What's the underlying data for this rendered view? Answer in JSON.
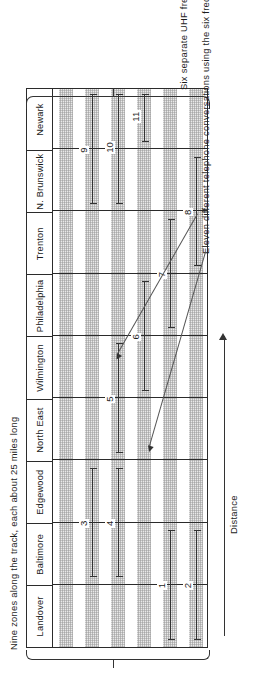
{
  "figure": {
    "caption_zones": "Nine zones along the track, each about 25 miles long",
    "caption_uhf": "Six separate UHF frequencies",
    "caption_conversations": "Eleven different telephone conversations using the six frequencies",
    "axis_label": "Distance",
    "colors": {
      "ink": "#2b2b2b",
      "band": "#e9e9e9",
      "leader": "#555555"
    }
  },
  "zones": [
    {
      "label": "Landover"
    },
    {
      "label": "Baltimore"
    },
    {
      "label": "Edgewood"
    },
    {
      "label": "North East"
    },
    {
      "label": "Wilmington"
    },
    {
      "label": "Philadelphia"
    },
    {
      "label": "Trenton"
    },
    {
      "label": "N. Brunswick"
    },
    {
      "label": "Newark"
    }
  ],
  "frequencies": [
    {
      "id": "f1"
    },
    {
      "id": "f2"
    },
    {
      "id": "f3"
    },
    {
      "id": "f4"
    },
    {
      "id": "f5"
    },
    {
      "id": "f6"
    }
  ],
  "conversations": [
    {
      "number": "1",
      "frequency": 5,
      "start_zone": 0,
      "end_zone": 1
    },
    {
      "number": "2",
      "frequency": 6,
      "start_zone": 0,
      "end_zone": 1
    },
    {
      "number": "3",
      "frequency": 2,
      "start_zone": 1,
      "end_zone": 2
    },
    {
      "number": "4",
      "frequency": 3,
      "start_zone": 1,
      "end_zone": 2
    },
    {
      "number": "5",
      "frequency": 3,
      "start_zone": 3,
      "end_zone": 4
    },
    {
      "number": "6",
      "frequency": 4,
      "start_zone": 4,
      "end_zone": 5
    },
    {
      "number": "7",
      "frequency": 5,
      "start_zone": 5,
      "end_zone": 6
    },
    {
      "number": "8",
      "frequency": 6,
      "start_zone": 6,
      "end_zone": 7
    },
    {
      "number": "9",
      "frequency": 2,
      "start_zone": 7,
      "end_zone": 8
    },
    {
      "number": "10",
      "frequency": 3,
      "start_zone": 7,
      "end_zone": 8
    },
    {
      "number": "11",
      "frequency": 4,
      "start_zone": 8,
      "end_zone": 8
    }
  ],
  "chart_data": {
    "type": "table",
    "xlabel": "Distance",
    "ylabel": "Six separate UHF frequencies",
    "categories": [
      "Landover",
      "Baltimore",
      "Edgewood",
      "North East",
      "Wilmington",
      "Philadelphia",
      "Trenton",
      "N. Brunswick",
      "Newark"
    ],
    "zone_length_miles": 25,
    "frequency_count": 6,
    "conversation_count": 11,
    "series": [
      {
        "name": "1",
        "frequency": 5,
        "zones": [
          "Landover",
          "Baltimore"
        ]
      },
      {
        "name": "2",
        "frequency": 6,
        "zones": [
          "Landover",
          "Baltimore"
        ]
      },
      {
        "name": "3",
        "frequency": 2,
        "zones": [
          "Baltimore",
          "Edgewood"
        ]
      },
      {
        "name": "4",
        "frequency": 3,
        "zones": [
          "Baltimore",
          "Edgewood"
        ]
      },
      {
        "name": "5",
        "frequency": 3,
        "zones": [
          "North East",
          "Wilmington"
        ]
      },
      {
        "name": "6",
        "frequency": 4,
        "zones": [
          "Wilmington",
          "Philadelphia"
        ]
      },
      {
        "name": "7",
        "frequency": 5,
        "zones": [
          "Philadelphia",
          "Trenton"
        ]
      },
      {
        "name": "8",
        "frequency": 6,
        "zones": [
          "Trenton",
          "N. Brunswick"
        ]
      },
      {
        "name": "9",
        "frequency": 2,
        "zones": [
          "N. Brunswick",
          "Newark"
        ]
      },
      {
        "name": "10",
        "frequency": 3,
        "zones": [
          "N. Brunswick",
          "Newark"
        ]
      },
      {
        "name": "11",
        "frequency": 4,
        "zones": [
          "Newark"
        ]
      }
    ],
    "grid": false,
    "legend": "none"
  }
}
